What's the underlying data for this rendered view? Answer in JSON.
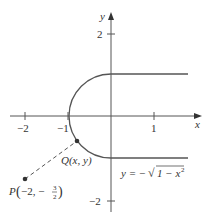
{
  "diagram": {
    "axes": {
      "x_label": "x",
      "y_label": "y",
      "x_ticks": [
        {
          "value": -2,
          "label": "−2"
        },
        {
          "value": -1,
          "label": "−1"
        },
        {
          "value": 1,
          "label": "1"
        }
      ],
      "y_ticks": [
        {
          "value": 2,
          "label": "2"
        },
        {
          "value": -2,
          "label": "−2"
        }
      ]
    },
    "curve": {
      "description": "left semicircle of unit circle joined to horizontal rays y=1 and y=-1 for x>=0",
      "equation_label_prefix": "y = −",
      "equation_label_radicand": "1 − x",
      "equation_label_exponent": "2"
    },
    "points": {
      "Q": {
        "label": "Q(x, y)",
        "letter": "Q",
        "coords": "(x, y)"
      },
      "P": {
        "letter": "P",
        "x_text": "−2, −",
        "frac_num": "3",
        "frac_den": "2",
        "x": -2,
        "y": -1.5
      }
    },
    "colors": {
      "stroke": "#555555",
      "text": "#333333"
    }
  }
}
